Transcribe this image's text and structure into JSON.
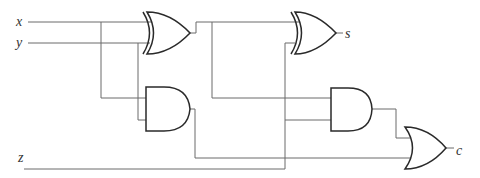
{
  "diagram": {
    "inputs": [
      {
        "id": "x",
        "label": "x"
      },
      {
        "id": "y",
        "label": "y"
      },
      {
        "id": "z",
        "label": "z"
      }
    ],
    "outputs": [
      {
        "id": "s",
        "label": "s"
      },
      {
        "id": "c",
        "label": "c"
      }
    ],
    "gates": [
      {
        "id": "xor1",
        "type": "XOR",
        "inputs": [
          "x",
          "y"
        ]
      },
      {
        "id": "and1",
        "type": "AND",
        "inputs": [
          "x",
          "y"
        ]
      },
      {
        "id": "xor2",
        "type": "XOR",
        "inputs": [
          "xor1",
          "z"
        ],
        "output": "s"
      },
      {
        "id": "and2",
        "type": "AND",
        "inputs": [
          "xor1",
          "z"
        ]
      },
      {
        "id": "or1",
        "type": "OR",
        "inputs": [
          "and2",
          "and1"
        ],
        "output": "c"
      }
    ],
    "colors": {
      "wire": "#6a6a6a",
      "gate": "#2a2a2a",
      "background": "#ffffff"
    }
  }
}
